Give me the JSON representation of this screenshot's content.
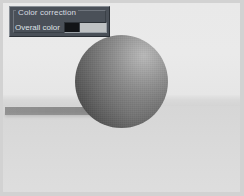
{
  "window": {
    "kind": "3d-render-viewport",
    "width": 244,
    "height": 196,
    "frame_color": "#d2d2d2"
  },
  "panel": {
    "title": "Color correction",
    "rows": [
      {
        "label": "Overall color",
        "control": "color-swatch",
        "swatch": {
          "left_color": "#121417",
          "right_color": "#bfc2c4"
        }
      }
    ],
    "background_color": "#4a5058",
    "text_color": "#d8dce0"
  },
  "scene": {
    "backdrop_color": "#e9e9e9",
    "ground_color": "#d8d8d8",
    "horizon_color": "#d9d9d9",
    "sphere": {
      "name": "shaded-sphere",
      "highlight_color": "#b9b9b9",
      "shadow_color": "#3e3e3e",
      "light_direction": "upper-right"
    },
    "cast_shadow": {
      "name": "cast-shadow",
      "color": "#7d7d7d"
    }
  }
}
